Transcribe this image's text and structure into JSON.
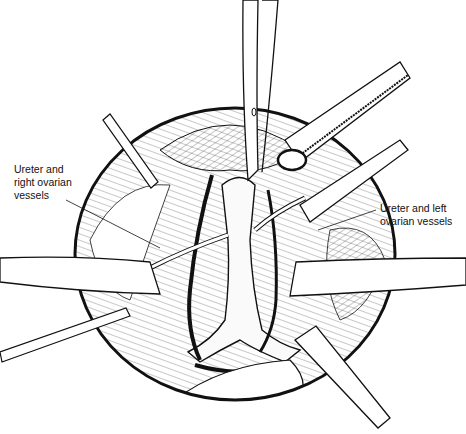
{
  "figure": {
    "type": "surgical line illustration",
    "colors": {
      "ink": "#111111",
      "background": "#ffffff"
    },
    "labels": [
      {
        "id": "right",
        "lines": [
          "Ureter and",
          "right ovarian",
          "vessels"
        ]
      },
      {
        "id": "left",
        "lines": [
          "Ureter and left",
          "ovarian vessels"
        ]
      }
    ]
  }
}
